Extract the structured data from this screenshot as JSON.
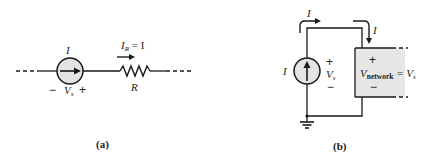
{
  "colors": {
    "wire": "#1a1a1a",
    "source_fill": "#e3e3e3",
    "network_fill": "#e6e6e6"
  },
  "circuit_a": {
    "caption": "(a)",
    "source_current_label": "I",
    "resistor_current_label_main": "I",
    "resistor_current_label_sub": "R",
    "resistor_current_label_rest": " = I",
    "source_voltage_minus": "−",
    "source_voltage_label_main": "V",
    "source_voltage_label_sub": "s",
    "source_voltage_plus": "+",
    "resistor_label": "R"
  },
  "circuit_b": {
    "caption": "(b)",
    "top_current_label": "I",
    "down_current_label": "I",
    "source_current_label": "I",
    "source_voltage_plus": "+",
    "source_voltage_label_main": "V",
    "source_voltage_label_sub": "s",
    "source_voltage_minus": "−",
    "network_plus": "+",
    "network_voltage_main": "V",
    "network_voltage_sub": "network",
    "network_voltage_rest": " = V",
    "network_voltage_rest_sub": "s",
    "network_minus": "−"
  }
}
